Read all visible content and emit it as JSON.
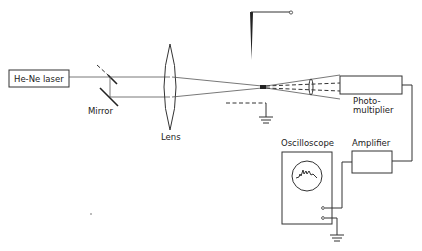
{
  "diagram": {
    "type": "optical-setup",
    "components": {
      "laser": {
        "label": "He-Ne laser"
      },
      "mirror": {
        "label": "Mirror"
      },
      "lens": {
        "label": "Lens"
      },
      "photomultiplier": {
        "label_line1": "Photo-",
        "label_line2": "multiplier"
      },
      "amplifier": {
        "label": "Amplifier"
      },
      "oscilloscope": {
        "label": "Oscilloscope"
      }
    },
    "elements": [
      "he-ne-laser",
      "beam-splitter",
      "mirror",
      "lens",
      "needle-electrode",
      "focal-region",
      "dashed-plate-electrode",
      "ground-symbol",
      "photomultiplier",
      "amplifier",
      "oscilloscope",
      "ground-symbol"
    ],
    "colors": {
      "line": "#333333",
      "background": "#ffffff"
    }
  }
}
